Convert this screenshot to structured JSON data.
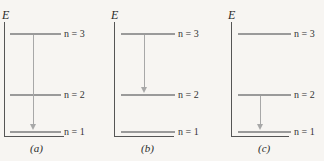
{
  "axis_label": "E",
  "level_labels": {
    "n3": "n = 3",
    "n2": "n = 2",
    "n1": "n = 1"
  },
  "panels": [
    {
      "id": "a",
      "caption": "(a)",
      "transition": {
        "from": "n = 3",
        "to": "n = 1"
      }
    },
    {
      "id": "b",
      "caption": "(b)",
      "transition": {
        "from": "n = 3",
        "to": "n = 2"
      }
    },
    {
      "id": "c",
      "caption": "(c)",
      "transition": {
        "from": "n = 2",
        "to": "n = 1"
      }
    }
  ],
  "colors": {
    "level_line": "#9a9a9a",
    "arrow": "#a8a8a8",
    "axis": "#555555",
    "background": "#f7f5f2"
  }
}
